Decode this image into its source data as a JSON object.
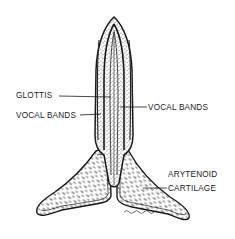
{
  "diagram": {
    "labels": {
      "glottis": "GLOTTIS",
      "vocal_bands_left": "VOCAL BANDS",
      "vocal_bands_right": "VOCAL BANDS",
      "arytenoid_line1": "ARYTENOID",
      "arytenoid_line2": "CARTILAGE"
    },
    "colors": {
      "background": "#ffffff",
      "ink": "#1a1a1a",
      "stipple": "#555555"
    }
  }
}
